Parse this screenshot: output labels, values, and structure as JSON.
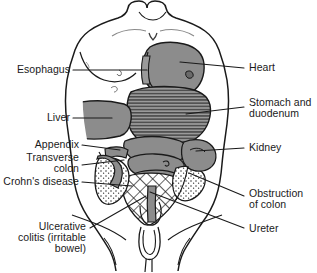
{
  "figure": {
    "view": "anterior torso, head omitted",
    "background_color": "#ffffff",
    "outline_color": "#1a1a1a",
    "organ_fill_gray": "#8c8c8c",
    "organ_fill_light": "#b5b5b5"
  },
  "labels": {
    "esophagus": "Esophagus",
    "liver": "Liver",
    "appendix": "Appendix",
    "transverse_colon_line1": "Transverse",
    "transverse_colon_line2": "colon",
    "crohns_disease": "Crohn's disease",
    "ulcerative_line1": "Ulcerative",
    "ulcerative_line2": "colitis (irritable",
    "ulcerative_line3": "bowel)",
    "heart": "Heart",
    "stomach_line1": "Stomach and",
    "stomach_line2": "duodenum",
    "kidney": "Kidney",
    "obstruction_line1": "Obstruction",
    "obstruction_line2": "of colon",
    "ureter": "Ureter"
  },
  "organs": [
    {
      "name": "heart",
      "fill": "solid-gray"
    },
    {
      "name": "stomach-and-duodenum",
      "fill": "horizontal-stripes"
    },
    {
      "name": "liver",
      "fill": "solid-gray"
    },
    {
      "name": "esophagus",
      "fill": "solid-gray"
    },
    {
      "name": "transverse-colon",
      "fill": "solid-gray"
    },
    {
      "name": "appendix",
      "fill": "solid-gray"
    },
    {
      "name": "crohns-disease-region",
      "fill": "crosshatch"
    },
    {
      "name": "ulcerative-colitis-region",
      "fill": "stipple"
    },
    {
      "name": "kidney",
      "fill": "solid-gray"
    },
    {
      "name": "ureter",
      "fill": "solid-gray"
    },
    {
      "name": "obstruction-of-colon",
      "fill": "stipple"
    }
  ]
}
